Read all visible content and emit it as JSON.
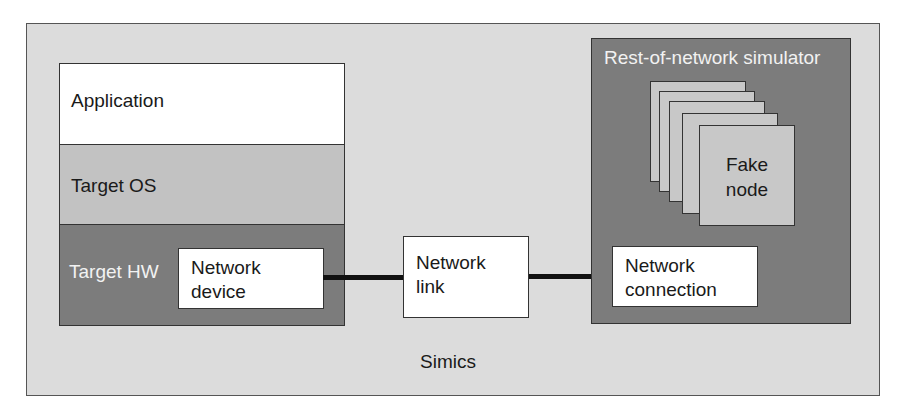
{
  "diagram": {
    "container": {
      "label": "Simics"
    },
    "target_stack": {
      "application": "Application",
      "target_os": "Target OS",
      "target_hw": "Target HW",
      "network_device": [
        "Network",
        "device"
      ]
    },
    "network_link": [
      "Network",
      "link"
    ],
    "rest_of_network": {
      "title": "Rest-of-network simulator",
      "fake_node": [
        "Fake",
        "node"
      ],
      "fake_node_count": 5,
      "network_connection": [
        "Network",
        "connection"
      ]
    },
    "colors": {
      "background": "#dcdcdc",
      "dark_gray": "#7c7c7c",
      "mid_gray": "#c2c2c2",
      "card_gray": "#c8c8c8",
      "white": "#ffffff",
      "line": "#111111"
    }
  }
}
